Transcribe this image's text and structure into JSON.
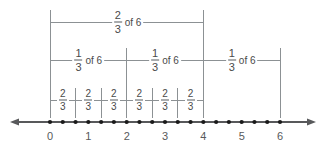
{
  "figure": {
    "type": "number-line-diagram",
    "colors": {
      "line": "#8c9194",
      "axis": "#58595b",
      "dot": "#1a1a1a",
      "text": "#58595b",
      "background": "#ffffff"
    }
  },
  "number_line": {
    "min": 0,
    "max": 6,
    "tick_labels": [
      "0",
      "1",
      "2",
      "3",
      "4",
      "5",
      "6"
    ],
    "tick_values": [
      0,
      1,
      2,
      3,
      4,
      5,
      6
    ],
    "dot_step": 0.3333333333,
    "dot_count": 19,
    "left_arrow": true,
    "right_arrow": true
  },
  "brackets": {
    "row_top": [
      {
        "label_numerator": "2",
        "label_denominator": "3",
        "label_suffix": "of 6",
        "start": 0,
        "end": 4
      }
    ],
    "row_middle": [
      {
        "label_numerator": "1",
        "label_denominator": "3",
        "label_suffix": "of 6",
        "start": 0,
        "end": 2
      },
      {
        "label_numerator": "1",
        "label_denominator": "3",
        "label_suffix": "of 6",
        "start": 2,
        "end": 4
      },
      {
        "label_numerator": "1",
        "label_denominator": "3",
        "label_suffix": "of 6",
        "start": 4,
        "end": 6
      }
    ],
    "row_bottom": [
      {
        "label_numerator": "2",
        "label_denominator": "3",
        "start": 0.0,
        "end": 0.6666667
      },
      {
        "label_numerator": "2",
        "label_denominator": "3",
        "start": 0.6666667,
        "end": 1.3333333
      },
      {
        "label_numerator": "2",
        "label_denominator": "3",
        "start": 1.3333333,
        "end": 2.0
      },
      {
        "label_numerator": "2",
        "label_denominator": "3",
        "start": 2.0,
        "end": 2.6666667
      },
      {
        "label_numerator": "2",
        "label_denominator": "3",
        "start": 2.6666667,
        "end": 3.3333333
      },
      {
        "label_numerator": "2",
        "label_denominator": "3",
        "start": 3.3333333,
        "end": 4.0
      }
    ]
  },
  "chart_data": {
    "type": "number-line",
    "xlabel": "",
    "ylabel": "",
    "xlim": [
      0,
      6
    ],
    "x_ticks": [
      0,
      1,
      2,
      3,
      4,
      5,
      6
    ],
    "x_tick_labels": [
      "0",
      "1",
      "2",
      "3",
      "4",
      "5",
      "6"
    ],
    "marked_points": [
      0,
      0.3333333,
      0.6666667,
      1,
      1.3333333,
      1.6666667,
      2,
      2.3333333,
      2.6666667,
      3,
      3.3333333,
      3.6666667,
      4,
      4.3333333,
      4.6666667,
      5,
      5.3333333,
      5.6666667,
      6
    ],
    "annotations": [
      {
        "text": "2/3 of 6",
        "span": [
          0,
          4
        ],
        "row": 1
      },
      {
        "text": "1/3 of 6",
        "span": [
          0,
          2
        ],
        "row": 2
      },
      {
        "text": "1/3 of 6",
        "span": [
          2,
          4
        ],
        "row": 2
      },
      {
        "text": "1/3 of 6",
        "span": [
          4,
          6
        ],
        "row": 2
      },
      {
        "text": "2/3",
        "span": [
          0,
          0.6666667
        ],
        "row": 3
      },
      {
        "text": "2/3",
        "span": [
          0.6666667,
          1.3333333
        ],
        "row": 3
      },
      {
        "text": "2/3",
        "span": [
          1.3333333,
          2
        ],
        "row": 3
      },
      {
        "text": "2/3",
        "span": [
          2,
          2.6666667
        ],
        "row": 3
      },
      {
        "text": "2/3",
        "span": [
          2.6666667,
          3.3333333
        ],
        "row": 3
      },
      {
        "text": "2/3",
        "span": [
          3.3333333,
          4
        ],
        "row": 3
      }
    ],
    "grid": false,
    "legend": "none"
  },
  "geometry": {
    "x_at_0": 50,
    "x_at_6": 280,
    "axis_y": 122,
    "row_top_y": 22,
    "row_middle_y": 60,
    "row_bottom_y": 100
  }
}
